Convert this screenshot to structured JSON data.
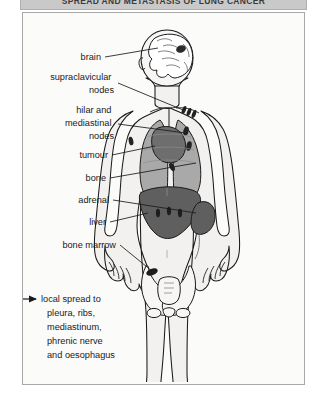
{
  "title": "Spread and metastasis of lung cancer",
  "panel": {
    "background_color": "#fbfbfa",
    "border_color": "#a8a8a8"
  },
  "colors": {
    "lung": "#a9a9a9",
    "tumour": "#6e6e6e",
    "liver": "#5f5f5f",
    "adrenal": "#5f5f5f",
    "body_fill": "#f2f1ef",
    "outline": "#1a1a1a",
    "node": "#222222",
    "title_bar": "#c9c9c9"
  },
  "labels": [
    {
      "id": "brain",
      "text": "brain",
      "lines": [
        "brain"
      ]
    },
    {
      "id": "supraclavicular-nodes",
      "text": "supraclavicular nodes",
      "lines": [
        "supraclavicular",
        "nodes"
      ]
    },
    {
      "id": "hilar-mediastinal-nodes",
      "text": "hilar and mediastinal nodes",
      "lines": [
        "hilar and",
        "mediastinal",
        "nodes"
      ]
    },
    {
      "id": "tumour",
      "text": "tumour",
      "lines": [
        "tumour"
      ]
    },
    {
      "id": "bone",
      "text": "bone",
      "lines": [
        "bone"
      ]
    },
    {
      "id": "adrenal",
      "text": "adrenal",
      "lines": [
        "adrenal"
      ]
    },
    {
      "id": "liver",
      "text": "liver",
      "lines": [
        "liver"
      ]
    },
    {
      "id": "bone-marrow",
      "text": "bone marrow",
      "lines": [
        "bone marrow"
      ]
    }
  ],
  "caption": {
    "arrow_icon": "right-arrow-icon",
    "lines": [
      "local spread to",
      "pleura, ribs,",
      "mediastinum,",
      "phrenic nerve",
      "and oesophagus"
    ]
  },
  "anatomy": [
    {
      "id": "brain",
      "name": "brain-cutaway"
    },
    {
      "id": "lungs",
      "name": "lungs"
    },
    {
      "id": "tumour-mass",
      "name": "primary-tumour"
    },
    {
      "id": "liver-organ",
      "name": "liver"
    },
    {
      "id": "adrenal-organ",
      "name": "adrenal-gland"
    },
    {
      "id": "pelvis",
      "name": "pelvis-bone"
    },
    {
      "id": "ribs",
      "name": "rib-cage"
    }
  ]
}
